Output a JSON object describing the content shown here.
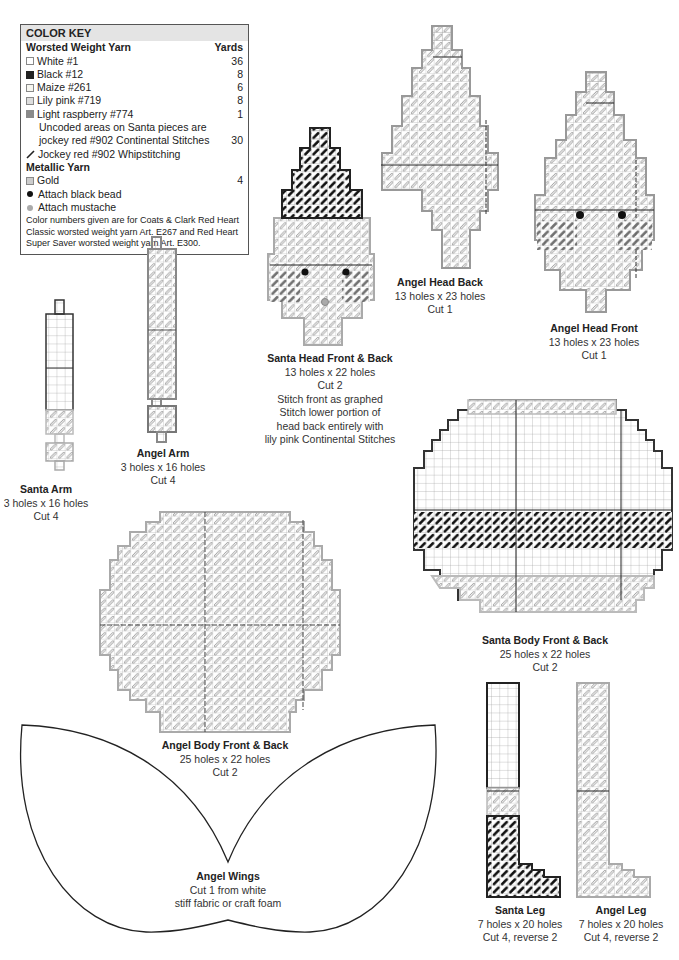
{
  "color_key": {
    "title": "COLOR KEY",
    "worsted": {
      "heading": "Worsted Weight Yarn",
      "yards_heading": "Yards",
      "items": [
        {
          "swatch": "#ffffff",
          "label": "White #1",
          "yards": "36"
        },
        {
          "swatch": "#222222",
          "label": "Black #12",
          "yards": "8"
        },
        {
          "swatch": "#f6f6f0",
          "label": "Maize #261",
          "yards": "6"
        },
        {
          "swatch": "#dddddd",
          "label": "Lily pink #719",
          "yards": "8"
        },
        {
          "swatch": "#8a8a8a",
          "label": "Light raspberry #774",
          "yards": "1"
        }
      ],
      "uncoded_line1": "Uncoded areas on Santa pieces are",
      "uncoded_line2": "jockey red #902 Continental Stitches",
      "uncoded_yards": "30",
      "whipstitch_label": "Jockey red #902 Whipstitching"
    },
    "metallic": {
      "heading": "Metallic Yarn",
      "items": [
        {
          "swatch": "#cccccc",
          "label": "Gold",
          "yards": "4"
        }
      ]
    },
    "attach": [
      {
        "label": "Attach black bead",
        "color": "#111111"
      },
      {
        "label": "Attach mustache",
        "color": "#aaaaaa"
      }
    ],
    "note": "Color numbers given are for Coats & Clark Red Heart Classic worsted weight yarn Art. E267 and Red Heart Super Saver worsted weight yarn Art. E300."
  },
  "pieces": {
    "santa_arm": {
      "title": "Santa Arm",
      "size": "3 holes x 16 holes",
      "cut": "Cut 4"
    },
    "angel_arm": {
      "title": "Angel Arm",
      "size": "3 holes x 16 holes",
      "cut": "Cut 4"
    },
    "santa_head": {
      "title": "Santa Head Front & Back",
      "size": "13 holes x 22 holes",
      "cut": "Cut 2",
      "note1": "Stitch front as graphed",
      "note2": "Stitch lower portion of",
      "note3": "head back entirely with",
      "note4": "lily pink Continental Stitches"
    },
    "angel_head_back": {
      "title": "Angel Head Back",
      "size": "13 holes x 23 holes",
      "cut": "Cut 1"
    },
    "angel_head_front": {
      "title": "Angel Head Front",
      "size": "13 holes x 23 holes",
      "cut": "Cut 1"
    },
    "santa_body": {
      "title": "Santa Body Front & Back",
      "size": "25 holes x 22 holes",
      "cut": "Cut 2"
    },
    "angel_body": {
      "title": "Angel Body Front & Back",
      "size": "25 holes x 22 holes",
      "cut": "Cut 2"
    },
    "angel_wings": {
      "title": "Angel Wings",
      "line1": "Cut 1 from white",
      "line2": "stiff fabric or craft foam"
    },
    "santa_leg": {
      "title": "Santa Leg",
      "size": "7 holes x 20 holes",
      "cut": "Cut 4, reverse 2"
    },
    "angel_leg": {
      "title": "Angel Leg",
      "size": "7 holes x 20 holes",
      "cut": "Cut 4, reverse 2"
    }
  }
}
